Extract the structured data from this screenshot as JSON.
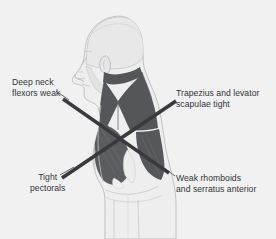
{
  "figure": {
    "background_color": "#f1f1f1",
    "body_fill": "#ececec",
    "body_outline": "#b9b9b9",
    "muscle_dark": "#555558",
    "muscle_mid": "#6d6d70",
    "crossline_color": "#3a3a3e",
    "text_color": "#30343a"
  },
  "labels": {
    "deep_neck": {
      "name": "Deep neck flexors weak",
      "line1": "Deep neck",
      "line2": "flexors weak"
    },
    "trapezius": {
      "name": "Trapezius and levator scapulae tight",
      "line1": "Trapezius and levator",
      "line2": "scapulae tight"
    },
    "pectorals": {
      "name": "Tight pectorals",
      "line1": "Tight",
      "line2": "pectorals"
    },
    "rhomboids": {
      "name": "Weak rhomboids and serratus anterior",
      "line1": "Weak rhomboids",
      "line2": "and serratus anterior"
    }
  },
  "cross_lines": [
    {
      "name": "weak-cross-line",
      "from": "deep neck flexors weak",
      "to": "weak rhomboids and serratus anterior",
      "x1": 63,
      "y1": 99,
      "x2": 168,
      "y2": 172
    },
    {
      "name": "tight-cross-line",
      "from": "tight pectorals",
      "to": "trapezius and levator scapulae tight",
      "x1": 62,
      "y1": 177,
      "x2": 176,
      "y2": 101
    }
  ],
  "leader_lines": [
    {
      "name": "deep-neck-leader",
      "x1": 56,
      "y1": 92,
      "x2": 68,
      "y2": 100
    },
    {
      "name": "pectorals-leader",
      "x1": 61,
      "y1": 175,
      "x2": 75,
      "y2": 167
    },
    {
      "name": "rhomboids-leader",
      "x1": 160,
      "y1": 166,
      "x2": 175,
      "y2": 176
    },
    {
      "name": "trapezius-leader",
      "x1": 165,
      "y1": 108,
      "x2": 178,
      "y2": 100
    }
  ]
}
